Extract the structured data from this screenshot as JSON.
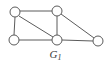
{
  "figure": {
    "caption_base": "G",
    "caption_subscript": "1",
    "caption_full": "G1",
    "background_color": "#ffffff",
    "stroke_color": "#5b5b5b",
    "vertex_fill_color": "#ffffff",
    "caption_color": "#3a3a3a"
  },
  "graph": {
    "vertex_radius": 5,
    "vertices": [
      {
        "id": "v1",
        "name": "top-left-vertex",
        "cx": 15,
        "cy": 12
      },
      {
        "id": "v2",
        "name": "top-middle-vertex",
        "cx": 57,
        "cy": 11
      },
      {
        "id": "v3",
        "name": "bottom-left-vertex",
        "cx": 14,
        "cy": 40
      },
      {
        "id": "v4",
        "name": "bottom-middle-vertex",
        "cx": 57,
        "cy": 40
      },
      {
        "id": "v5",
        "name": "right-vertex",
        "cx": 98,
        "cy": 41
      }
    ],
    "edges": [
      {
        "id": "e1",
        "name": "edge-top-left-to-top-middle",
        "from": "v1",
        "to": "v2",
        "x1": 20,
        "y1": 11,
        "x2": 52,
        "y2": 11
      },
      {
        "id": "e2",
        "name": "edge-top-left-to-bottom-left",
        "from": "v1",
        "to": "v3",
        "x1": 15,
        "y1": 17,
        "x2": 14,
        "y2": 35
      },
      {
        "id": "e3",
        "name": "edge-top-left-to-bottom-middle",
        "from": "v1",
        "to": "v4",
        "x1": 19,
        "y1": 16,
        "x2": 53,
        "y2": 37
      },
      {
        "id": "e4",
        "name": "edge-top-middle-to-bottom-middle",
        "from": "v2",
        "to": "v4",
        "x1": 57,
        "y1": 16,
        "x2": 57,
        "y2": 35
      },
      {
        "id": "e5",
        "name": "edge-top-middle-to-right",
        "from": "v2",
        "to": "v5",
        "x1": 61,
        "y1": 14,
        "x2": 94,
        "y2": 38
      },
      {
        "id": "e6",
        "name": "edge-bottom-left-to-bottom-middle",
        "from": "v3",
        "to": "v4",
        "x1": 19,
        "y1": 40,
        "x2": 52,
        "y2": 40
      },
      {
        "id": "e7",
        "name": "edge-bottom-middle-to-right",
        "from": "v4",
        "to": "v5",
        "x1": 62,
        "y1": 40,
        "x2": 93,
        "y2": 41
      }
    ]
  }
}
